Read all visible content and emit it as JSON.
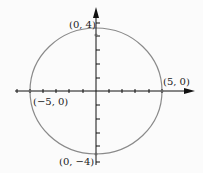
{
  "diagram": {
    "type": "ellipse-on-axes",
    "equation_hint": "x^2/25 + y^2/16 = 1",
    "center": [
      0,
      0
    ],
    "semi_major": 5,
    "semi_minor": 4,
    "colors": {
      "ellipse": "#8a8a8a",
      "axis": "#111111",
      "background": "#fbfbfb"
    },
    "points": [
      {
        "label": "(0, 4)"
      },
      {
        "label": "(5, 0)"
      },
      {
        "label": "(−5, 0)"
      },
      {
        "label": "(0, −4)"
      }
    ]
  }
}
